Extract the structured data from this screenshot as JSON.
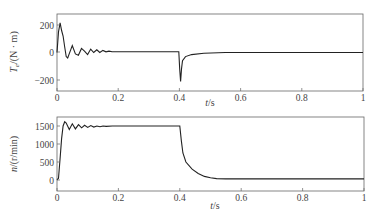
{
  "chart_data": [
    {
      "type": "line",
      "title": "",
      "xlabel": "t/s",
      "ylabel": "Te/(N·m)",
      "ylabel_main": "T",
      "ylabel_sub": "e",
      "ylabel_rest": "/(N · m)",
      "xlim": [
        0,
        1
      ],
      "ylim": [
        -260,
        280
      ],
      "xticks": [
        "0",
        "0.2",
        "0.4",
        "0.6",
        "0.8",
        "1"
      ],
      "yticks": [
        "200",
        "0",
        "−200"
      ],
      "grid": false,
      "series": [
        {
          "name": "Te",
          "x": [
            0,
            0.005,
            0.01,
            0.015,
            0.02,
            0.025,
            0.03,
            0.035,
            0.04,
            0.05,
            0.06,
            0.07,
            0.08,
            0.09,
            0.1,
            0.11,
            0.12,
            0.13,
            0.14,
            0.15,
            0.16,
            0.17,
            0.18,
            0.2,
            0.3,
            0.398,
            0.401,
            0.404,
            0.407,
            0.41,
            0.42,
            0.44,
            0.48,
            0.55,
            0.6,
            0.8,
            1.0
          ],
          "values": [
            0,
            150,
            215,
            160,
            120,
            40,
            -30,
            -40,
            -10,
            50,
            -10,
            -20,
            30,
            10,
            -15,
            25,
            0,
            20,
            0,
            15,
            5,
            10,
            5,
            5,
            5,
            5,
            -120,
            -210,
            -120,
            -60,
            -30,
            -15,
            -5,
            0,
            0,
            0,
            0
          ]
        }
      ]
    },
    {
      "type": "line",
      "title": "",
      "xlabel": "t/s",
      "ylabel": "n/(r/min)",
      "xlim": [
        0,
        1
      ],
      "ylim": [
        -100,
        1850
      ],
      "xticks": [
        "0",
        "0.2",
        "0.4",
        "0.6",
        "0.8",
        "1"
      ],
      "yticks": [
        "1500",
        "1000",
        "500",
        "0"
      ],
      "grid": false,
      "series": [
        {
          "name": "n",
          "x": [
            0,
            0.005,
            0.01,
            0.015,
            0.02,
            0.025,
            0.03,
            0.04,
            0.05,
            0.06,
            0.07,
            0.08,
            0.09,
            0.1,
            0.11,
            0.12,
            0.13,
            0.14,
            0.15,
            0.16,
            0.18,
            0.2,
            0.3,
            0.4,
            0.405,
            0.41,
            0.42,
            0.44,
            0.46,
            0.48,
            0.5,
            0.52,
            0.55,
            0.6,
            0.8,
            1.0
          ],
          "values": [
            0,
            50,
            600,
            1150,
            1500,
            1620,
            1580,
            1400,
            1560,
            1420,
            1540,
            1450,
            1520,
            1460,
            1510,
            1470,
            1500,
            1480,
            1500,
            1490,
            1500,
            1500,
            1500,
            1500,
            1100,
            750,
            500,
            300,
            180,
            100,
            60,
            40,
            30,
            30,
            30,
            30
          ]
        }
      ]
    }
  ]
}
